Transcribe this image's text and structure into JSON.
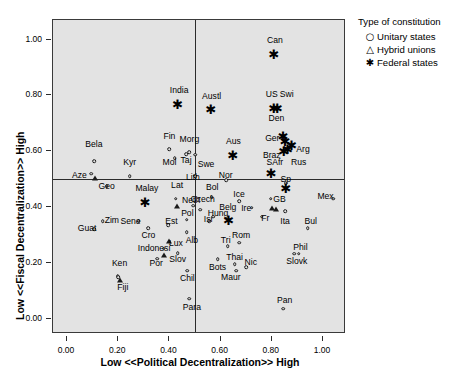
{
  "chart_data": {
    "type": "scatter",
    "title": "",
    "xlabel": "Low <<Political Decentralization>> High",
    "ylabel": "Low <<Fiscal Decentralization>> High",
    "xlim": [
      -0.055,
      1.09
    ],
    "ylim": [
      -0.055,
      1.07
    ],
    "xticks": [
      0.0,
      0.2,
      0.4,
      0.6,
      0.8,
      1.0
    ],
    "xticklabels": [
      "0.00",
      "0.20",
      "0.40",
      "0.60",
      "0.80",
      "1.00"
    ],
    "yticks": [
      0.0,
      0.2,
      0.4,
      0.6,
      0.8,
      1.0
    ],
    "yticklabels": [
      "0.00",
      "0.20",
      "0.40",
      "0.60",
      "0.80",
      "1.00"
    ],
    "grid": false,
    "reference_lines": {
      "x": 0.5,
      "y": 0.5
    },
    "plot_background": "#e3e3e3",
    "marker_color": "#1a1a1a",
    "legend": {
      "position": "outside-top-right",
      "title": "Type of constitution",
      "entries": [
        {
          "label": "Unitary states",
          "glyph": "circle-open",
          "symbol": "○"
        },
        {
          "label": "Hybrid unions",
          "glyph": "triangle-open",
          "symbol": "△"
        },
        {
          "label": "Federal states",
          "glyph": "asterisk-filled",
          "symbol": "✱"
        }
      ]
    },
    "series": [
      {
        "name": "Unitary states",
        "marker": "circle-open",
        "points": [
          {
            "label": "Bela",
            "x": 0.105,
            "y": 0.565,
            "lx": 0.105,
            "ly": 0.625
          },
          {
            "label": "Aze",
            "x": 0.095,
            "y": 0.52,
            "lx": 0.048,
            "ly": 0.515
          },
          {
            "label": "Geo",
            "x": 0.155,
            "y": 0.475,
            "lx": 0.155,
            "ly": 0.475
          },
          {
            "label": "Kyr",
            "x": 0.245,
            "y": 0.51,
            "lx": 0.245,
            "ly": 0.56
          },
          {
            "label": "Fin",
            "x": 0.4,
            "y": 0.608,
            "lx": 0.4,
            "ly": 0.655
          },
          {
            "label": "Mol",
            "x": 0.42,
            "y": 0.575,
            "lx": 0.4,
            "ly": 0.562
          },
          {
            "label": "Taj",
            "x": 0.465,
            "y": 0.59,
            "lx": 0.465,
            "ly": 0.57
          },
          {
            "label": "Morg",
            "x": 0.478,
            "y": 0.596,
            "lx": 0.478,
            "ly": 0.645
          },
          {
            "label": "Swe",
            "x": 0.5,
            "y": 0.588,
            "lx": 0.543,
            "ly": 0.555
          },
          {
            "label": "Lith",
            "x": 0.5,
            "y": 0.51,
            "lx": 0.492,
            "ly": 0.508
          },
          {
            "label": "Lat",
            "x": 0.425,
            "y": 0.43,
            "lx": 0.43,
            "ly": 0.48
          },
          {
            "label": "Neth",
            "x": 0.492,
            "y": 0.405,
            "lx": 0.485,
            "ly": 0.425
          },
          {
            "label": "Bol",
            "x": 0.565,
            "y": 0.435,
            "lx": 0.567,
            "ly": 0.47
          },
          {
            "label": "Nor",
            "x": 0.622,
            "y": 0.495,
            "lx": 0.62,
            "ly": 0.515
          },
          {
            "label": "Czech",
            "x": 0.52,
            "y": 0.39,
            "lx": 0.53,
            "ly": 0.43
          },
          {
            "label": "Ice",
            "x": 0.672,
            "y": 0.42,
            "lx": 0.672,
            "ly": 0.445
          },
          {
            "label": "GB",
            "x": 0.795,
            "y": 0.43,
            "lx": 0.83,
            "ly": 0.428
          },
          {
            "label": "Mex",
            "x": 1.04,
            "y": 0.43,
            "lx": 1.01,
            "ly": 0.44
          },
          {
            "label": "Sp",
            "x": 0.855,
            "y": 0.485,
            "lx": 0.855,
            "ly": 0.5
          },
          {
            "label": "Ire",
            "x": 0.722,
            "y": 0.398,
            "lx": 0.7,
            "ly": 0.398
          },
          {
            "label": "Isr",
            "x": 0.555,
            "y": 0.35,
            "lx": 0.553,
            "ly": 0.358
          },
          {
            "label": "Hung",
            "x": 0.572,
            "y": 0.365,
            "lx": 0.59,
            "ly": 0.378
          },
          {
            "label": "Pol",
            "x": 0.468,
            "y": 0.355,
            "lx": 0.47,
            "ly": 0.378
          },
          {
            "label": "Est",
            "x": 0.395,
            "y": 0.335,
            "lx": 0.408,
            "ly": 0.35
          },
          {
            "label": "Sene",
            "x": 0.28,
            "y": 0.35,
            "lx": 0.248,
            "ly": 0.35
          },
          {
            "label": "Zim",
            "x": 0.14,
            "y": 0.35,
            "lx": 0.175,
            "ly": 0.352
          },
          {
            "label": "Guat",
            "x": 0.105,
            "y": 0.32,
            "lx": 0.078,
            "ly": 0.325
          },
          {
            "label": "Cro",
            "x": 0.318,
            "y": 0.325,
            "lx": 0.318,
            "ly": 0.298
          },
          {
            "label": "Alb",
            "x": 0.468,
            "y": 0.31,
            "lx": 0.488,
            "ly": 0.28
          },
          {
            "label": "Fr",
            "x": 0.76,
            "y": 0.365,
            "lx": 0.775,
            "ly": 0.36
          },
          {
            "label": "Ita",
            "x": 0.852,
            "y": 0.385,
            "lx": 0.852,
            "ly": 0.35
          },
          {
            "label": "Bul",
            "x": 0.94,
            "y": 0.325,
            "lx": 0.952,
            "ly": 0.35
          },
          {
            "label": "Por",
            "x": 0.352,
            "y": 0.215,
            "lx": 0.348,
            "ly": 0.2
          },
          {
            "label": "Slov",
            "x": 0.432,
            "y": 0.235,
            "lx": 0.432,
            "ly": 0.212
          },
          {
            "label": "Ken",
            "x": 0.198,
            "y": 0.152,
            "lx": 0.205,
            "ly": 0.198
          },
          {
            "label": "Chil",
            "x": 0.47,
            "y": 0.172,
            "lx": 0.47,
            "ly": 0.145
          },
          {
            "label": "Para",
            "x": 0.478,
            "y": 0.072,
            "lx": 0.488,
            "ly": 0.04
          },
          {
            "label": "Bots",
            "x": 0.588,
            "y": 0.212,
            "lx": 0.588,
            "ly": 0.185
          },
          {
            "label": "Tri",
            "x": 0.628,
            "y": 0.26,
            "lx": 0.62,
            "ly": 0.282
          },
          {
            "label": "Rom",
            "x": 0.672,
            "y": 0.272,
            "lx": 0.68,
            "ly": 0.298
          },
          {
            "label": "Thai",
            "x": 0.655,
            "y": 0.195,
            "lx": 0.655,
            "ly": 0.222
          },
          {
            "label": "Nic",
            "x": 0.7,
            "y": 0.185,
            "lx": 0.718,
            "ly": 0.202
          },
          {
            "label": "Maur",
            "x": 0.66,
            "y": 0.172,
            "lx": 0.64,
            "ly": 0.15
          },
          {
            "label": "Phil",
            "x": 0.888,
            "y": 0.232,
            "lx": 0.912,
            "ly": 0.258
          },
          {
            "label": "Slovk",
            "x": 0.905,
            "y": 0.232,
            "lx": 0.898,
            "ly": 0.205
          },
          {
            "label": "Pan",
            "x": 0.845,
            "y": 0.035,
            "lx": 0.85,
            "ly": 0.068
          },
          {
            "label": "Fiji",
            "x": 0.2,
            "y": 0.148,
            "lx": 0.218,
            "ly": 0.112
          },
          {
            "label": "Indonesi",
            "x": 0.378,
            "y": 0.25,
            "lx": 0.34,
            "ly": 0.252
          }
        ]
      },
      {
        "name": "Hybrid unions",
        "marker": "triangle-open",
        "points": [
          {
            "label": "",
            "x": 0.108,
            "y": 0.505,
            "lx": 0.108,
            "ly": 0.505
          },
          {
            "label": "",
            "x": 0.43,
            "y": 0.405,
            "lx": 0.43,
            "ly": 0.405
          },
          {
            "label": "Lux",
            "x": 0.4,
            "y": 0.278,
            "lx": 0.425,
            "ly": 0.272
          },
          {
            "label": "",
            "x": 0.378,
            "y": 0.228,
            "lx": 0.378,
            "ly": 0.228
          },
          {
            "label": "",
            "x": 0.205,
            "y": 0.14,
            "lx": 0.205,
            "ly": 0.14
          },
          {
            "label": "",
            "x": 0.802,
            "y": 0.398,
            "lx": 0.802,
            "ly": 0.398
          },
          {
            "label": "",
            "x": 0.818,
            "y": 0.392,
            "lx": 0.818,
            "ly": 0.392
          }
        ]
      },
      {
        "name": "Federal states",
        "marker": "asterisk-filled",
        "points": [
          {
            "label": "India",
            "x": 0.432,
            "y": 0.768,
            "lx": 0.438,
            "ly": 0.818
          },
          {
            "label": "Austl",
            "x": 0.562,
            "y": 0.752,
            "lx": 0.565,
            "ly": 0.798
          },
          {
            "label": "Can",
            "x": 0.808,
            "y": 0.948,
            "lx": 0.812,
            "ly": 0.998
          },
          {
            "label": "US",
            "x": 0.808,
            "y": 0.755,
            "lx": 0.8,
            "ly": 0.805
          },
          {
            "label": "Swi",
            "x": 0.822,
            "y": 0.755,
            "lx": 0.858,
            "ly": 0.805
          },
          {
            "label": "Den",
            "x": 0.845,
            "y": 0.655,
            "lx": 0.818,
            "ly": 0.718
          },
          {
            "label": "Ger",
            "x": 0.852,
            "y": 0.635,
            "lx": 0.802,
            "ly": 0.648
          },
          {
            "label": "Arg",
            "x": 0.878,
            "y": 0.622,
            "lx": 0.922,
            "ly": 0.608
          },
          {
            "label": "Braz",
            "x": 0.848,
            "y": 0.6,
            "lx": 0.8,
            "ly": 0.588
          },
          {
            "label": "Rus",
            "x": 0.862,
            "y": 0.608,
            "lx": 0.905,
            "ly": 0.562
          },
          {
            "label": "SAfr",
            "x": 0.798,
            "y": 0.522,
            "lx": 0.812,
            "ly": 0.562
          },
          {
            "label": "Aus",
            "x": 0.648,
            "y": 0.588,
            "lx": 0.65,
            "ly": 0.638
          },
          {
            "label": "Malay",
            "x": 0.305,
            "y": 0.418,
            "lx": 0.312,
            "ly": 0.468
          },
          {
            "label": "Belg",
            "x": 0.632,
            "y": 0.355,
            "lx": 0.628,
            "ly": 0.4
          },
          {
            "label": "",
            "x": 0.855,
            "y": 0.468,
            "lx": 0.855,
            "ly": 0.468
          }
        ]
      }
    ]
  }
}
